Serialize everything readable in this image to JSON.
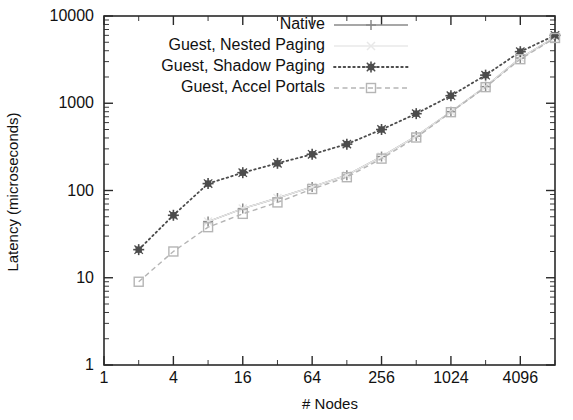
{
  "chart_data": {
    "type": "line",
    "title": "",
    "xlabel": "# Nodes",
    "ylabel": "Latency (microseconds)",
    "xscale": "log2",
    "yscale": "log10",
    "xlim": [
      1,
      8192
    ],
    "ylim": [
      1,
      10000
    ],
    "xtick_labels": [
      "1",
      "4",
      "16",
      "64",
      "256",
      "1024",
      "4096"
    ],
    "xtick_values": [
      1,
      4,
      16,
      64,
      256,
      1024,
      4096
    ],
    "ytick_labels": [
      "1",
      "10",
      "100",
      "1000",
      "10000"
    ],
    "ytick_values": [
      1,
      10,
      100,
      1000,
      10000
    ],
    "grid": false,
    "legend_position": "top-right-inside",
    "x": [
      2,
      4,
      8,
      16,
      32,
      64,
      128,
      256,
      512,
      1024,
      2048,
      4096,
      8192
    ],
    "series": [
      {
        "name": "Native",
        "marker": "plus",
        "line": "solid",
        "color": "#8a8a8a",
        "values": [
          null,
          null,
          44,
          62,
          82,
          110,
          150,
          245,
          420,
          800,
          1550,
          3300,
          5700
        ]
      },
      {
        "name": "Guest, Nested Paging",
        "marker": "cross-faint",
        "line": "solid-faint",
        "color": "#e8e8e8",
        "values": [
          null,
          null,
          44,
          62,
          82,
          110,
          150,
          245,
          420,
          800,
          1550,
          3300,
          5700
        ]
      },
      {
        "name": "Guest, Shadow Paging",
        "marker": "star",
        "line": "dotted",
        "color": "#4d4d4d",
        "values": [
          21,
          52,
          120,
          160,
          205,
          260,
          340,
          500,
          760,
          1220,
          2100,
          3900,
          6000
        ]
      },
      {
        "name": "Guest, Accel Portals",
        "marker": "open-square",
        "line": "dashed",
        "color": "#b5b5b5",
        "values": [
          9,
          20,
          38,
          54,
          73,
          104,
          142,
          232,
          405,
          790,
          1530,
          3200,
          5600
        ]
      }
    ]
  },
  "axes": {
    "y_title": "Latency (microseconds)",
    "x_title": "# Nodes"
  },
  "legend": {
    "entries": [
      {
        "label": "Native"
      },
      {
        "label": "Guest, Nested Paging"
      },
      {
        "label": "Guest, Shadow Paging"
      },
      {
        "label": "Guest, Accel Portals"
      }
    ]
  }
}
